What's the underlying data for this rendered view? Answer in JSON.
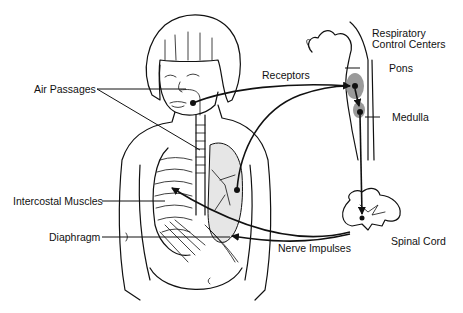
{
  "diagram": {
    "type": "anatomical-illustration",
    "labels": {
      "respiratory_control_centers": "Respiratory\nControl Centers",
      "respiratory_line1": "Respiratory",
      "respiratory_line2": "Control Centers",
      "pons": "Pons",
      "medulla": "Medulla",
      "receptors": "Receptors",
      "air_passages": "Air Passages",
      "intercostal_muscles": "Intercostal Muscles",
      "diaphragm": "Diaphragm",
      "nerve_impulses": "Nerve Impulses",
      "spinal_cord": "Spinal Cord"
    },
    "colors": {
      "line": "#111111",
      "highlight": "#9a9a9a",
      "background": "#ffffff",
      "stipple": "#e6e6e6"
    }
  }
}
